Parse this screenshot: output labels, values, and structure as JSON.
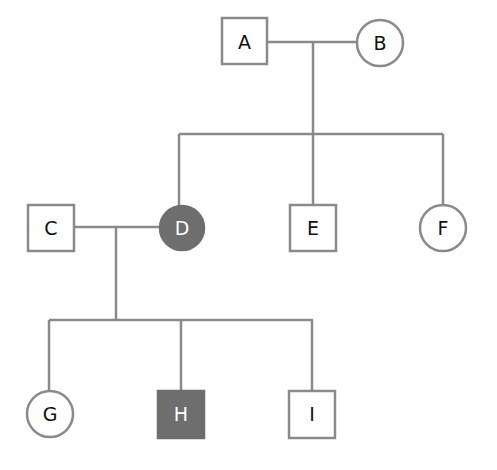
{
  "diagram": {
    "type": "pedigree-chart",
    "colors": {
      "line": "#8a8a8a",
      "affected": "#6e6e6e",
      "unaffected": "#ffffff"
    },
    "generations": [
      {
        "level": 1,
        "individuals": [
          {
            "id": "A",
            "label": "A",
            "sex": "male",
            "shape": "square",
            "affected": false
          },
          {
            "id": "B",
            "label": "B",
            "sex": "female",
            "shape": "circle",
            "affected": false
          }
        ],
        "partnerships": [
          [
            "A",
            "B"
          ]
        ]
      },
      {
        "level": 2,
        "individuals": [
          {
            "id": "C",
            "label": "C",
            "sex": "male",
            "shape": "square",
            "affected": false,
            "married_in": true
          },
          {
            "id": "D",
            "label": "D",
            "sex": "female",
            "shape": "circle",
            "affected": true,
            "parents": [
              "A",
              "B"
            ]
          },
          {
            "id": "E",
            "label": "E",
            "sex": "male",
            "shape": "square",
            "affected": false,
            "parents": [
              "A",
              "B"
            ]
          },
          {
            "id": "F",
            "label": "F",
            "sex": "female",
            "shape": "circle",
            "affected": false,
            "parents": [
              "A",
              "B"
            ]
          }
        ],
        "partnerships": [
          [
            "C",
            "D"
          ]
        ]
      },
      {
        "level": 3,
        "individuals": [
          {
            "id": "G",
            "label": "G",
            "sex": "female",
            "shape": "circle",
            "affected": false,
            "parents": [
              "C",
              "D"
            ]
          },
          {
            "id": "H",
            "label": "H",
            "sex": "male",
            "shape": "square",
            "affected": true,
            "parents": [
              "C",
              "D"
            ]
          },
          {
            "id": "I",
            "label": "I",
            "sex": "male",
            "shape": "square",
            "affected": false,
            "parents": [
              "C",
              "D"
            ]
          }
        ]
      }
    ],
    "labels": {
      "A": "A",
      "B": "B",
      "C": "C",
      "D": "D",
      "E": "E",
      "F": "F",
      "G": "G",
      "H": "H",
      "I": "I"
    }
  }
}
